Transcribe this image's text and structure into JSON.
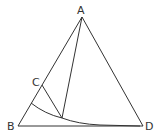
{
  "diagram": {
    "type": "geometry",
    "labels": {
      "A": "A",
      "B": "B",
      "C": "C",
      "D": "D"
    },
    "points": {
      "A": [
        82,
        17
      ],
      "B": [
        18,
        126
      ],
      "D": [
        143,
        126
      ],
      "C": [
        42,
        85
      ],
      "P": [
        62,
        118
      ],
      "arc_start": [
        31,
        103
      ]
    },
    "colors": {
      "stroke": "#333333",
      "background": "#ffffff"
    }
  }
}
